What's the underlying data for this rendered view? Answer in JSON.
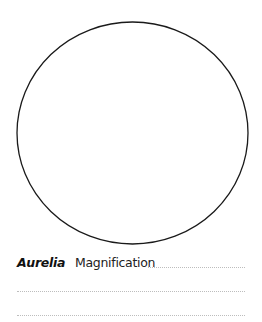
{
  "worksheet": {
    "specimen_name": "Aurelia",
    "magnification_label": "Magnification",
    "magnification_value": "",
    "notes_lines": [
      "",
      ""
    ],
    "drawing_area": {
      "shape": "circle",
      "stroke_color": "#1a1a1a"
    },
    "rule_color": "#bdbdbd"
  }
}
